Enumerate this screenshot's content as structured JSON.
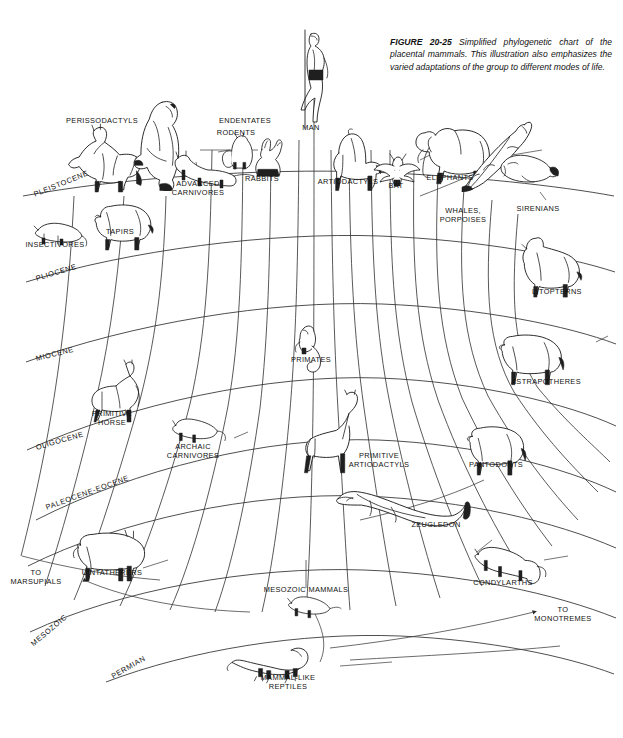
{
  "figure": {
    "caption_head": "FIGURE 20-25",
    "caption_text": "Simplified phylogenetic chart of the placental mammals. This illustration also emphasizes the varied adaptations of the group to different modes of life."
  },
  "chart_data": {
    "type": "diagram",
    "title": "Simplified phylogenetic chart of the placental mammals",
    "subtype": "fan-shaped phylogenetic tree",
    "grid": "radiating lineage lines with curved geologic time arcs",
    "time_axis_direction": "bottom (oldest) to top (youngest)",
    "periods": [
      {
        "label": "PLEISTOCENE",
        "x": 34,
        "y": 190,
        "rotate": -22
      },
      {
        "label": "PLIOCENE",
        "x": 36,
        "y": 274,
        "rotate": -17
      },
      {
        "label": "MIOCENE",
        "x": 36,
        "y": 354,
        "rotate": -14
      },
      {
        "label": "OLIGOCENE",
        "x": 36,
        "y": 443,
        "rotate": -16
      },
      {
        "label": "PALEOCENE-EOCENE",
        "x": 46,
        "y": 503,
        "rotate": -20
      },
      {
        "label": "MESOZOIC",
        "x": 32,
        "y": 640,
        "rotate": -40
      },
      {
        "label": "PERMIAN",
        "x": 112,
        "y": 672,
        "rotate": -30
      }
    ],
    "taxa": [
      {
        "label": "PERISSODACTYLS",
        "x": 102,
        "y": 117
      },
      {
        "label": "ENDENTATES",
        "x": 245,
        "y": 117
      },
      {
        "label": "RODENTS",
        "x": 236,
        "y": 129
      },
      {
        "label": "MAN",
        "x": 311,
        "y": 124
      },
      {
        "label": "RABBITS",
        "x": 262,
        "y": 175
      },
      {
        "label": "ARTIODACTYLS",
        "x": 348,
        "y": 178
      },
      {
        "label": "BAT",
        "x": 396,
        "y": 182
      },
      {
        "label": "ELEPHANTS",
        "x": 450,
        "y": 174
      },
      {
        "label": "ADVANCED\nCARNIVORES",
        "x": 198,
        "y": 180
      },
      {
        "label": "TAPIRS",
        "x": 120,
        "y": 228
      },
      {
        "label": "INSECTIVORES",
        "x": 55,
        "y": 241
      },
      {
        "label": "WHALES,\nPORPOISES",
        "x": 463,
        "y": 207
      },
      {
        "label": "SIRENIANS",
        "x": 538,
        "y": 205
      },
      {
        "label": "LITOPTERNS",
        "x": 557,
        "y": 288
      },
      {
        "label": "PRIMATES",
        "x": 311,
        "y": 356
      },
      {
        "label": "ASTRAPOTHERES",
        "x": 546,
        "y": 378
      },
      {
        "label": "PRIMITIVE\nHORSE",
        "x": 112,
        "y": 410
      },
      {
        "label": "ARCHAIC\nCARNIVORES",
        "x": 193,
        "y": 443
      },
      {
        "label": "PRIMITIVE\nARTIODACTYLS",
        "x": 379,
        "y": 452
      },
      {
        "label": "PANTODONTS",
        "x": 496,
        "y": 461
      },
      {
        "label": "ZEUGLEDON",
        "x": 436,
        "y": 521
      },
      {
        "label": "UINTATHERERS",
        "x": 112,
        "y": 569
      },
      {
        "label": "TO\nMARSUPIALS",
        "x": 36,
        "y": 569
      },
      {
        "label": "CONDYLARTHS",
        "x": 503,
        "y": 579
      },
      {
        "label": "MESOZOIC MAMMALS",
        "x": 306,
        "y": 586
      },
      {
        "label": "TO\nMONOTREMES",
        "x": 563,
        "y": 606
      },
      {
        "label": "MAMMAL-LIKE\nREPTILES",
        "x": 288,
        "y": 674
      }
    ]
  },
  "colors": {
    "ink": "#1a1a1a",
    "line": "#2b2b2b",
    "background": "#ffffff"
  }
}
